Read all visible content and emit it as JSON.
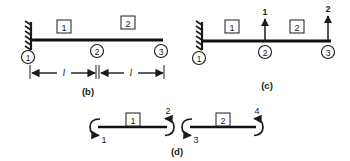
{
  "figure": {
    "type": "structural-analysis-beam-diagram",
    "panels": [
      {
        "id": "b",
        "caption": "(b)",
        "description": "Propped beam with fixed support at left, two elements, three nodes, span dimensions",
        "support": {
          "type": "fixed-hatched-wall",
          "at_node": "1"
        },
        "nodes": [
          {
            "label": "1",
            "x": 28,
            "y": 57
          },
          {
            "label": "2",
            "x": 97,
            "y": 50
          },
          {
            "label": "3",
            "x": 160,
            "y": 50
          }
        ],
        "elements": [
          {
            "label": "1",
            "x": 64,
            "y": 27
          },
          {
            "label": "2",
            "x": 128,
            "y": 23
          }
        ],
        "dimensions": [
          {
            "label": "l",
            "from_x": 30,
            "to_x": 96,
            "y": 73
          },
          {
            "label": "l",
            "from_x": 99,
            "to_x": 163,
            "y": 73
          }
        ],
        "caption_x": 88,
        "caption_y": 92
      },
      {
        "id": "c",
        "caption": "(c)",
        "description": "Same beam showing applied unit loads as upward arrows at nodes 2 and 3",
        "support": {
          "type": "fixed-hatched-wall",
          "at_node": "1"
        },
        "nodes": [
          {
            "label": "1",
            "x": 199,
            "y": 57
          },
          {
            "label": "2",
            "x": 265,
            "y": 50
          },
          {
            "label": "3",
            "x": 328,
            "y": 50
          }
        ],
        "elements": [
          {
            "label": "1",
            "x": 232,
            "y": 26
          },
          {
            "label": "2",
            "x": 297,
            "y": 26
          }
        ],
        "loads": [
          {
            "label": "1",
            "x": 265,
            "direction": "up",
            "tip_y": 18,
            "tail_y": 41
          },
          {
            "label": "2",
            "x": 328,
            "direction": "up",
            "tip_y": 15,
            "tail_y": 41
          }
        ],
        "caption_x": 267,
        "caption_y": 86
      },
      {
        "id": "d",
        "caption": "(d)",
        "description": "Disconnected elements showing end rotational degrees of freedom",
        "elements": [
          {
            "label": "1",
            "x_start": 98,
            "x_end": 167,
            "y": 127,
            "dof_start": {
              "label": "1",
              "sense": "counterclockwise"
            },
            "dof_end": {
              "label": "2",
              "sense": "counterclockwise"
            }
          },
          {
            "label": "2",
            "x_start": 190,
            "x_end": 256,
            "y": 127,
            "dof_start": {
              "label": "3",
              "sense": "counterclockwise"
            },
            "dof_end": {
              "label": "4",
              "sense": "counterclockwise"
            }
          }
        ],
        "caption_x": 177,
        "caption_y": 152
      }
    ],
    "colors": {
      "ink": "#1a1a1a",
      "beam": "#111111",
      "background": "#ffffff"
    }
  }
}
